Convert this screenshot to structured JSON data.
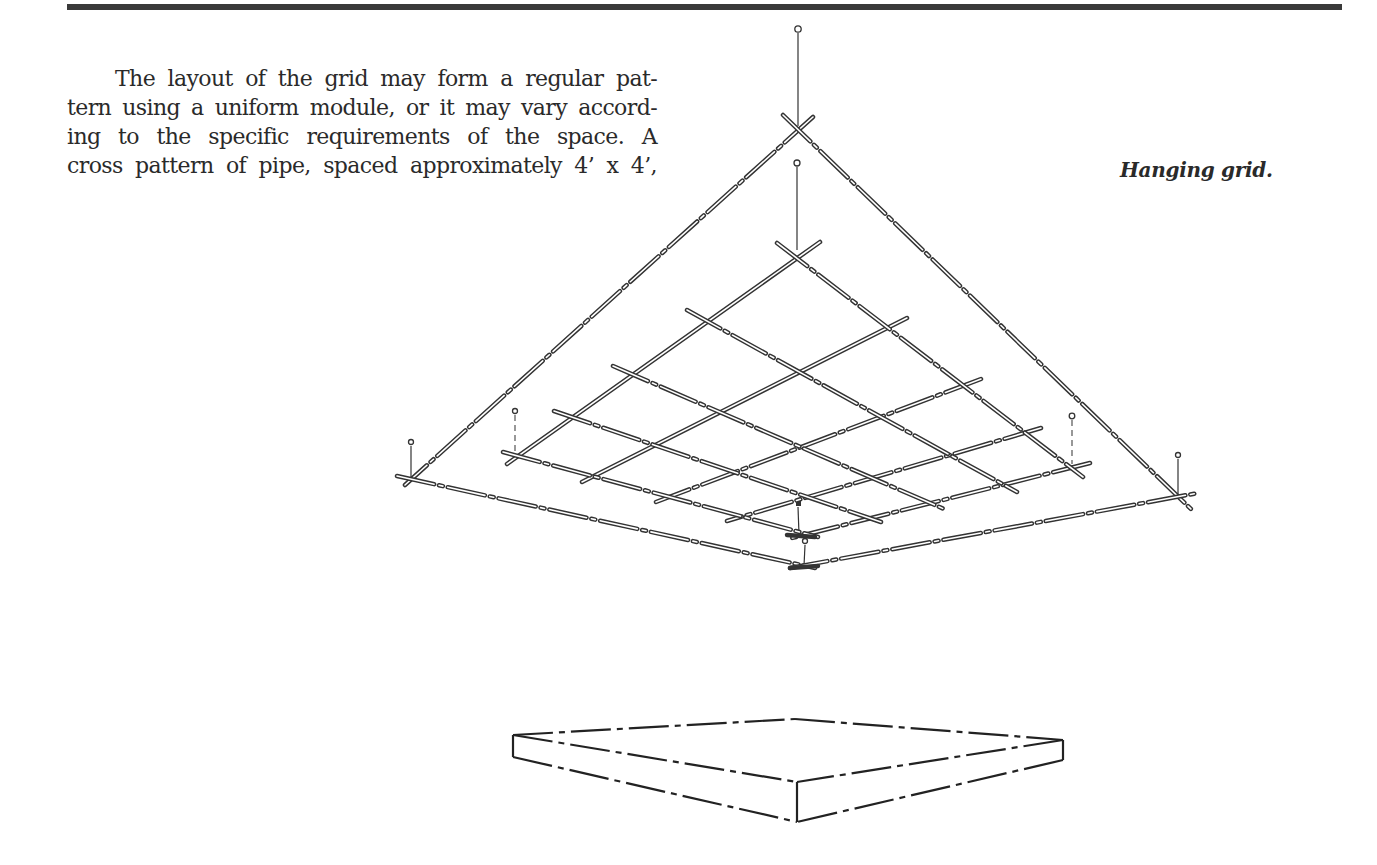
{
  "page": {
    "body_text_lines": [
      "The layout of the grid may form a regular pat-",
      "tern using a uniform module, or it may vary accord-",
      "ing to the specific requirements of the space. A",
      "cross pattern of pipe, spaced approximately 4’ x 4’,"
    ],
    "figure_caption": "Hanging grid."
  },
  "figure": {
    "elements": {
      "outer_frame": "large square pipe frame hung from a single top wire and corner wires",
      "inner_grid": "cross pattern of pipes forming a 5 x 5 module grid",
      "platform": "rectangular stage platform below the grid"
    }
  }
}
